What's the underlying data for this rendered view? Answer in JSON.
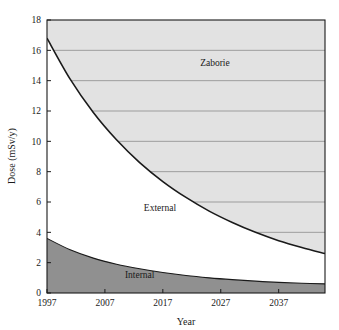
{
  "chart_data": {
    "type": "area",
    "title": "",
    "xlabel": "Year",
    "ylabel": "Dose (mSv/y)",
    "xlim": [
      1997,
      2045
    ],
    "ylim": [
      0,
      18
    ],
    "xticks": [
      "1997",
      "2007",
      "2017",
      "2027",
      "2037"
    ],
    "xtick_values": [
      1997,
      2007,
      2017,
      2027,
      2037
    ],
    "yticks": [
      "0",
      "2",
      "4",
      "6",
      "8",
      "10",
      "12",
      "14",
      "16",
      "18"
    ],
    "ytick_values": [
      0,
      2,
      4,
      6,
      8,
      10,
      12,
      14,
      16,
      18
    ],
    "grid": "horizontal-inside-shaded-region",
    "legend": "in-plot-labels",
    "annotations": [
      {
        "text": "Zaborie",
        "x": 2026,
        "y": 15.0
      },
      {
        "text": "External",
        "x": 2016.5,
        "y": 5.4
      },
      {
        "text": "Internal",
        "x": 2013,
        "y": 1.0
      }
    ],
    "x": [
      1997,
      2001,
      2005,
      2009,
      2013,
      2017,
      2021,
      2025,
      2029,
      2033,
      2037,
      2041,
      2045
    ],
    "series": [
      {
        "name": "Internal",
        "label": "Internal",
        "color": "#909090",
        "values": [
          3.6,
          2.85,
          2.3,
          1.9,
          1.6,
          1.35,
          1.15,
          1.0,
          0.88,
          0.78,
          0.7,
          0.64,
          0.6
        ]
      },
      {
        "name": "External",
        "label": "External",
        "color": "#ffffff",
        "values": [
          16.8,
          14.1,
          11.9,
          10.1,
          8.6,
          7.35,
          6.3,
          5.4,
          4.65,
          4.0,
          3.45,
          3.0,
          2.6
        ]
      },
      {
        "name": "Zaborie",
        "label": "Zaborie",
        "color": "#e2e2e2",
        "values": [
          18,
          18,
          18,
          18,
          18,
          18,
          18,
          18,
          18,
          18,
          18,
          18,
          18
        ]
      }
    ],
    "colors": {
      "zaborie_fill": "#e2e2e2",
      "external_fill": "#ffffff",
      "internal_fill": "#909090",
      "curve_stroke": "#1a1a1a",
      "gridline": "#808080",
      "axis": "#1a1a1a",
      "background": "#ffffff"
    }
  }
}
